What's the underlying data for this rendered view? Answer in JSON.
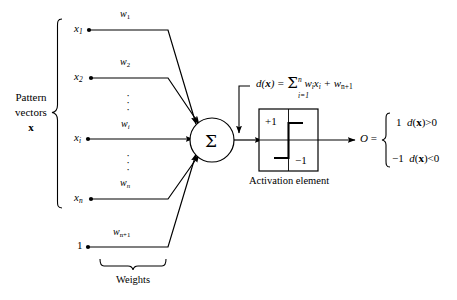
{
  "figure": {
    "stroke_color": "#000000",
    "background_color": "#ffffff"
  },
  "inputs": {
    "group_label_line1": "Pattern",
    "group_label_line2": "vectors",
    "group_label_line3": "x",
    "nodes": [
      {
        "name": "x1",
        "label": "x",
        "subscript": "1",
        "weight_label": "w",
        "weight_subscript": "1"
      },
      {
        "name": "x2",
        "label": "x",
        "subscript": "2",
        "weight_label": "w",
        "weight_subscript": "2"
      },
      {
        "name": "xi",
        "label": "x",
        "subscript": "i",
        "weight_label": "w",
        "weight_subscript": "i"
      },
      {
        "name": "xn",
        "label": "x",
        "subscript": "n",
        "weight_label": "w",
        "weight_subscript": "n"
      }
    ],
    "bias": {
      "label": "1",
      "weight_label": "w",
      "weight_subscript": "n+1"
    },
    "vertical_dots": "·"
  },
  "weights_brace": {
    "label": "Weights"
  },
  "summation": {
    "symbol": "Σ",
    "name": "summing-junction"
  },
  "discriminant": {
    "lhs": "d(x) =",
    "sigma": "Σ",
    "upper_limit": "n",
    "lower_limit": "i=1",
    "term1_w": "w",
    "term1_w_sub": "i",
    "term1_x": "x",
    "term1_x_sub": "i",
    "plus": "+",
    "term2_w": "w",
    "term2_w_sub": "n+1"
  },
  "activation": {
    "caption": "Activation element",
    "high_label": "+1",
    "low_label": "−1"
  },
  "output": {
    "symbol": "O =",
    "cases": [
      {
        "value": "1",
        "condition_fn": "d(x)",
        "operator": ">",
        "threshold": "0"
      },
      {
        "value": "−1",
        "condition_fn": "d(x)",
        "operator": "<",
        "threshold": "0"
      }
    ]
  }
}
